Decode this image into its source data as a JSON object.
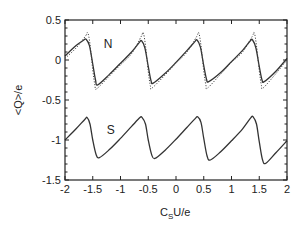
{
  "chart_data": {
    "type": "line",
    "title": "",
    "xlabel": "C_S U/e",
    "xlabel_main": "C",
    "xlabel_sub": "S",
    "xlabel_rest": "U/e",
    "ylabel": "<Q>/e",
    "xlim": [
      -2,
      2
    ],
    "ylim": [
      -1.5,
      0.5
    ],
    "xticks": [
      -2,
      -1.5,
      -1,
      -0.5,
      0,
      0.5,
      1,
      1.5,
      2
    ],
    "xtick_labels": [
      "-2",
      "-1.5",
      "-1",
      "-0.5",
      "0",
      "0.5",
      "1",
      "1.5",
      "2"
    ],
    "yticks": [
      0.5,
      0,
      -0.5,
      -1,
      -1.5
    ],
    "ytick_labels": [
      "0.5",
      "0",
      "-0.5",
      "-1",
      "-1.5"
    ],
    "y_minor_step": 0.1,
    "grid": false,
    "annotations": [
      {
        "text": "N",
        "x": -1.3,
        "y": 0.15
      },
      {
        "text": "S",
        "x": -1.25,
        "y": -0.92
      }
    ],
    "series": [
      {
        "name": "N (solid)",
        "style": "solid",
        "x": [
          -2.0,
          -1.8,
          -1.66,
          -1.62,
          -1.56,
          -1.5,
          -1.45,
          -1.41,
          -1.2,
          -1.0,
          -0.8,
          -0.66,
          -0.62,
          -0.56,
          -0.5,
          -0.45,
          -0.41,
          -0.2,
          0.0,
          0.2,
          0.34,
          0.38,
          0.44,
          0.5,
          0.55,
          0.59,
          0.8,
          1.0,
          1.2,
          1.34,
          1.38,
          1.44,
          1.5,
          1.55,
          1.59,
          1.8,
          2.0
        ],
        "y": [
          0.05,
          0.18,
          0.25,
          0.26,
          0.18,
          -0.05,
          -0.25,
          -0.31,
          -0.18,
          -0.04,
          0.1,
          0.22,
          0.24,
          0.15,
          -0.08,
          -0.26,
          -0.29,
          -0.17,
          -0.03,
          0.12,
          0.23,
          0.25,
          0.16,
          -0.07,
          -0.24,
          -0.27,
          -0.16,
          -0.02,
          0.12,
          0.24,
          0.25,
          0.15,
          -0.08,
          -0.25,
          -0.27,
          -0.14,
          0.02
        ]
      },
      {
        "name": "N (dotted)",
        "style": "dotted",
        "x": [
          -2.0,
          -1.8,
          -1.63,
          -1.59,
          -1.55,
          -1.5,
          -1.46,
          -1.43,
          -1.2,
          -1.0,
          -0.8,
          -0.63,
          -0.59,
          -0.55,
          -0.5,
          -0.46,
          -0.43,
          -0.2,
          0.0,
          0.2,
          0.37,
          0.41,
          0.45,
          0.5,
          0.54,
          0.57,
          0.8,
          1.0,
          1.2,
          1.37,
          1.41,
          1.45,
          1.5,
          1.54,
          1.57,
          1.8,
          2.0
        ],
        "y": [
          0.02,
          0.15,
          0.3,
          0.34,
          0.2,
          -0.12,
          -0.32,
          -0.36,
          -0.2,
          -0.06,
          0.08,
          0.29,
          0.34,
          0.18,
          -0.14,
          -0.33,
          -0.35,
          -0.19,
          -0.04,
          0.1,
          0.29,
          0.34,
          0.18,
          -0.13,
          -0.32,
          -0.35,
          -0.18,
          -0.03,
          0.1,
          0.29,
          0.34,
          0.18,
          -0.13,
          -0.32,
          -0.35,
          -0.17,
          0.0
        ]
      },
      {
        "name": "S",
        "style": "solid",
        "x": [
          -2.0,
          -1.8,
          -1.64,
          -1.6,
          -1.55,
          -1.5,
          -1.44,
          -1.38,
          -1.2,
          -1.0,
          -0.8,
          -0.65,
          -0.61,
          -0.55,
          -0.5,
          -0.44,
          -0.38,
          -0.2,
          0.0,
          0.2,
          0.35,
          0.39,
          0.45,
          0.5,
          0.56,
          0.62,
          0.8,
          1.0,
          1.2,
          1.35,
          1.39,
          1.45,
          1.5,
          1.56,
          1.62,
          1.8,
          2.0
        ],
        "y": [
          -1.0,
          -0.86,
          -0.74,
          -0.72,
          -0.8,
          -1.0,
          -1.18,
          -1.22,
          -1.12,
          -0.98,
          -0.83,
          -0.72,
          -0.72,
          -0.8,
          -1.0,
          -1.18,
          -1.23,
          -1.13,
          -0.99,
          -0.84,
          -0.73,
          -0.71,
          -0.78,
          -0.98,
          -1.2,
          -1.25,
          -1.15,
          -1.01,
          -0.86,
          -0.72,
          -0.71,
          -0.8,
          -1.02,
          -1.25,
          -1.29,
          -1.16,
          -1.01
        ]
      }
    ]
  }
}
